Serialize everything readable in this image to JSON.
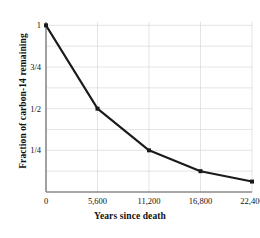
{
  "chart_data": {
    "type": "line",
    "title": "",
    "xlabel": "Years since death",
    "ylabel": "Fraction of carbon-14 remaining",
    "x": [
      0,
      5600,
      11200,
      16800,
      22400
    ],
    "values": [
      1,
      0.5,
      0.25,
      0.125,
      0.0625
    ],
    "xtick_labels": [
      "0",
      "5,600",
      "11,200",
      "16,800",
      "22,400"
    ],
    "xtick_values": [
      0,
      5600,
      11200,
      16800,
      22400
    ],
    "ytick_labels": [
      "1/4",
      "1/2",
      "3/4",
      "1"
    ],
    "ytick_values": [
      0.25,
      0.5,
      0.75,
      1
    ],
    "xlim": [
      0,
      22400
    ],
    "ylim": [
      0,
      1.02
    ],
    "grid": true,
    "legend": false,
    "series_name": "Fraction of carbon-14 remaining",
    "line_color": "#1a1a1a",
    "marker": "square",
    "marker_color": "#1a1a1a",
    "grid_color": "#d8d8d8",
    "axis_color": "#808080",
    "background_color": "#ffffff"
  }
}
